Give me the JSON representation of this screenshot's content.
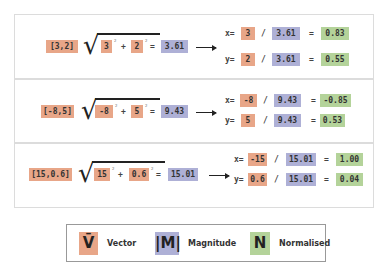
{
  "colors": {
    "vector": "#e8a688",
    "magnitude": "#aeb0d6",
    "normalised": "#b4d39a"
  },
  "rows": [
    {
      "vector": "[3,2]",
      "a": "3",
      "b": "2",
      "plus": "+",
      "eq": "=",
      "sup": "2",
      "magnitude": "3.61",
      "x_label": "x=",
      "y_label": "y=",
      "div": "/",
      "x_num": "3",
      "y_num": "2",
      "x_mag": "3.61",
      "y_mag": "3.61",
      "x_res": "0.83",
      "y_res": "0.55"
    },
    {
      "vector": "[-8,5]",
      "a": "-8",
      "b": "5",
      "plus": "+",
      "eq": "=",
      "sup": "2",
      "magnitude": "9.43",
      "x_label": "x=",
      "y_label": "y=",
      "div": "/",
      "x_num": "-8",
      "y_num": "5",
      "x_mag": "9.43",
      "y_mag": "9.43",
      "x_res": "-0.85",
      "y_res": "0.53"
    },
    {
      "vector": "[15,0.6]",
      "a": "15",
      "b": "0.6",
      "plus": "+",
      "eq": "=",
      "sup": "2",
      "magnitude": "15.01",
      "x_label": "x=",
      "y_label": "y=",
      "div": "/",
      "x_num": "-15",
      "y_num": "0.6",
      "x_mag": "15.01",
      "y_mag": "15.01",
      "x_res": "1.00",
      "y_res": "0.04"
    }
  ],
  "legend": {
    "vector_symbol": "V̄",
    "vector_label": "Vector",
    "magnitude_symbol": "|M|",
    "magnitude_label": "Magnitude",
    "normalised_symbol": "N",
    "normalised_label": "Normalised"
  }
}
